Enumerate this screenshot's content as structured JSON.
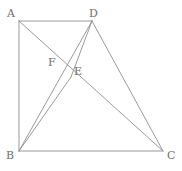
{
  "figure": {
    "width": 182,
    "height": 171,
    "background_color": "#ffffff",
    "stroke_color": "#8f8f8f",
    "label_color": "#6f6f6f",
    "stroke_width": 0.9,
    "points": {
      "A": {
        "label": "A",
        "x": 19,
        "y": 21,
        "label_x": 7,
        "label_y": 8
      },
      "B": {
        "label": "B",
        "x": 19,
        "y": 151,
        "label_x": 6,
        "label_y": 150
      },
      "C": {
        "label": "C",
        "x": 163,
        "y": 151,
        "label_x": 167,
        "label_y": 150
      },
      "D": {
        "label": "D",
        "x": 92,
        "y": 21,
        "label_x": 89,
        "label_y": 8
      },
      "E": {
        "label": "E",
        "x": 71,
        "y": 77,
        "label_x": 74,
        "label_y": 66
      },
      "F": {
        "label": "F",
        "x": 61,
        "y": 58,
        "label_x": 48,
        "label_y": 57
      }
    },
    "segments": [
      {
        "name": "segment-AD",
        "from": "A",
        "to": "D"
      },
      {
        "name": "segment-AB",
        "from": "A",
        "to": "B"
      },
      {
        "name": "segment-BC",
        "from": "B",
        "to": "C"
      },
      {
        "name": "segment-DC",
        "from": "D",
        "to": "C"
      },
      {
        "name": "segment-AC",
        "from": "A",
        "to": "C"
      },
      {
        "name": "segment-DB",
        "from": "D",
        "to": "B"
      },
      {
        "name": "segment-BE",
        "from": "B",
        "to": "E"
      },
      {
        "name": "segment-DE",
        "from": "D",
        "to": "E"
      }
    ]
  }
}
